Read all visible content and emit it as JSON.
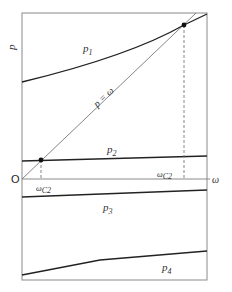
{
  "diagram": {
    "axes": {
      "y_label": "p",
      "x_label": "ω",
      "origin_label": "O"
    },
    "curves": [
      {
        "id": "p1",
        "label": "p",
        "subscript": "1",
        "style": "solid-dark"
      },
      {
        "id": "p2",
        "label": "p",
        "subscript": "2",
        "style": "solid-dark"
      },
      {
        "id": "p3",
        "label": "p",
        "subscript": "3",
        "style": "solid-dark"
      },
      {
        "id": "p4",
        "label": "p",
        "subscript": "4",
        "style": "solid-dark"
      },
      {
        "id": "diagonal",
        "label": "p = ω",
        "style": "solid-thin-gray"
      }
    ],
    "intersections": [
      {
        "id": "low",
        "label": "ω",
        "subscript": "C2",
        "between": [
          "diagonal",
          "p2"
        ]
      },
      {
        "id": "high",
        "label": "ω",
        "subscript": "C2",
        "between": [
          "diagonal",
          "p1"
        ]
      }
    ],
    "colors": {
      "curve": "#222222",
      "diagonal": "#777777",
      "frame": "#888888",
      "dashed": "#777777"
    }
  }
}
